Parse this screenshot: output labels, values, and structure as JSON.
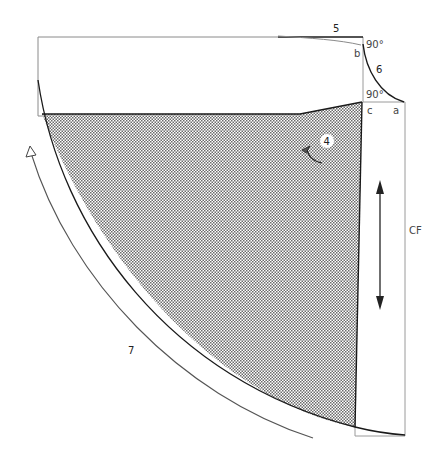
{
  "diagram": {
    "type": "sewing-pattern-piece",
    "colors": {
      "background": "#ffffff",
      "outline_thin": "#8a8a8a",
      "outline_bold": "#1a1a1a",
      "hatch_dark": "#555555",
      "hatch_light": "#ffffff",
      "label": "#444444"
    },
    "labels": {
      "seam_5": "5",
      "seam_6": "6",
      "step_4": "4",
      "arrow_7": "7",
      "point_a": "a",
      "point_b": "b",
      "point_c": "c",
      "angle_top": "90°",
      "angle_bottom": "90°",
      "center_front": "CF"
    }
  }
}
